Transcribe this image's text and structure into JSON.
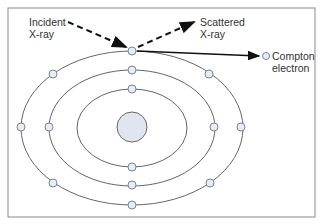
{
  "diagram": {
    "labels": {
      "incident_line1": "Incident",
      "incident_line2": "X-ray",
      "scattered_line1": "Scattered",
      "scattered_line2": "X-ray",
      "compton_line1": "Compton",
      "compton_line2": "electron"
    },
    "colors": {
      "border": "#8a8a8a",
      "orbit": "#666666",
      "electron_fill": "#e6edf5",
      "electron_stroke": "#7a8594",
      "nucleus_fill": "#dfe6ef",
      "arrow": "#111111"
    },
    "orbits": 3,
    "electrons_per_orbit": [
      2,
      4,
      6
    ]
  }
}
